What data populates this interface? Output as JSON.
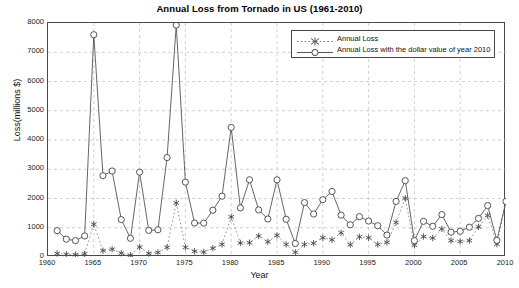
{
  "chart_data": {
    "type": "line",
    "title": "Annual Loss from Tornado in US (1961-2010)",
    "xlabel": "Year",
    "ylabel": "Loss(millions $)",
    "xlim": [
      1960,
      2010
    ],
    "ylim": [
      0,
      8000
    ],
    "xticks": [
      1960,
      1965,
      1970,
      1975,
      1980,
      1985,
      1990,
      1995,
      2000,
      2005,
      2010
    ],
    "yticks": [
      0,
      1000,
      2000,
      3000,
      4000,
      5000,
      6000,
      7000,
      8000
    ],
    "grid": true,
    "legend_position": "top-right",
    "x": [
      1961,
      1962,
      1963,
      1964,
      1965,
      1966,
      1967,
      1968,
      1969,
      1970,
      1971,
      1972,
      1973,
      1974,
      1975,
      1976,
      1977,
      1978,
      1979,
      1980,
      1981,
      1982,
      1983,
      1984,
      1985,
      1986,
      1987,
      1988,
      1989,
      1990,
      1991,
      1992,
      1993,
      1994,
      1995,
      1996,
      1997,
      1998,
      1999,
      2000,
      2001,
      2002,
      2003,
      2004,
      2005,
      2006,
      2007,
      2008,
      2009,
      2010
    ],
    "series": [
      {
        "name": "Annual Loss",
        "marker": "asterisk",
        "linestyle": "dotted",
        "color": "#7a7a7a",
        "values": [
          120,
          90,
          80,
          110,
          1120,
          215,
          265,
          130,
          60,
          340,
          120,
          155,
          330,
          1850,
          330,
          195,
          170,
          300,
          430,
          1370,
          480,
          490,
          720,
          520,
          740,
          430,
          160,
          430,
          470,
          660,
          590,
          830,
          420,
          690,
          660,
          430,
          500,
          1180,
          2010,
          400,
          700,
          650,
          960,
          560,
          530,
          560,
          1030,
          1420,
          440,
          1900
        ]
      },
      {
        "name": "Annual Loss with the dollar value of year 2010",
        "marker": "circle",
        "linestyle": "solid",
        "color": "#555555",
        "values": [
          900,
          610,
          560,
          720,
          7600,
          2780,
          2940,
          1280,
          640,
          2900,
          910,
          930,
          3400,
          7930,
          2560,
          1160,
          1160,
          1600,
          2080,
          4430,
          1680,
          2640,
          1610,
          1300,
          2640,
          1290,
          460,
          1860,
          1470,
          1960,
          2240,
          1430,
          1100,
          1380,
          1230,
          1070,
          750,
          1900,
          2610,
          560,
          1220,
          1050,
          1450,
          850,
          880,
          1020,
          1320,
          1760,
          570,
          1900
        ]
      }
    ]
  },
  "legend": {
    "items": [
      {
        "label": "Annual Loss"
      },
      {
        "label": "Annual Loss with the dollar value of year 2010"
      }
    ]
  }
}
